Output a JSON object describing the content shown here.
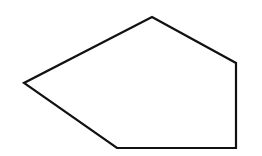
{
  "diagram": {
    "shape": "pentagon",
    "fill": "#ffffff",
    "stroke": "#111111",
    "stroke_width": 2.2,
    "vertices": [
      [
        152,
        17
      ],
      [
        236,
        63
      ],
      [
        236,
        148
      ],
      [
        117,
        148
      ],
      [
        24,
        83
      ]
    ]
  }
}
